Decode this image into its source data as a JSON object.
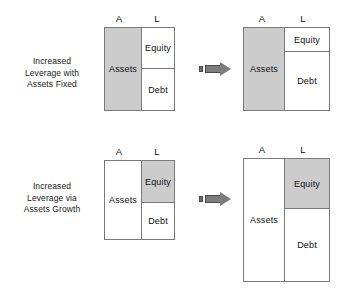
{
  "figure": {
    "column_headers": {
      "assets": "A",
      "liabilities": "L"
    },
    "footer_caption": ""
  },
  "rows": [
    {
      "caption_lines": [
        "Increased",
        "Leverage with",
        "Assets Fixed"
      ],
      "arrow": {
        "name": "right-arrow"
      },
      "before": {
        "assets_label": "Assets",
        "equity_label": "Equity",
        "debt_label": "Debt",
        "assets_shaded": true,
        "equity_shaded": false,
        "debt_shaded": false
      },
      "after": {
        "assets_label": "Assets",
        "equity_label": "Equity",
        "debt_label": "Debt",
        "assets_shaded": true,
        "equity_shaded": false,
        "debt_shaded": false
      }
    },
    {
      "caption_lines": [
        "Increased",
        "Leverage via",
        "Assets Growth"
      ],
      "arrow": {
        "name": "right-arrow"
      },
      "before": {
        "assets_label": "Assets",
        "equity_label": "Equity",
        "debt_label": "Debt",
        "assets_shaded": false,
        "equity_shaded": true,
        "debt_shaded": false
      },
      "after": {
        "assets_label": "Assets",
        "equity_label": "Equity",
        "debt_label": "Debt",
        "assets_shaded": false,
        "equity_shaded": true,
        "debt_shaded": false
      }
    }
  ],
  "colors": {
    "shade": "#cccccc",
    "stroke": "#7a7a7a",
    "text": "#111111",
    "arrow_fill": "#7d7d7d",
    "arrow_stroke": "#4a4a4a"
  }
}
